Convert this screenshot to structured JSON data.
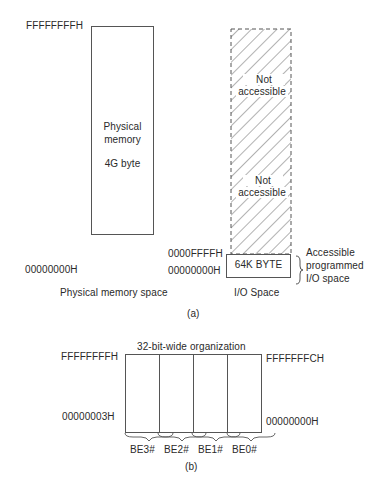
{
  "part_a": {
    "caption": "(a)",
    "physical_memory": {
      "top_address": "FFFFFFFFH",
      "bottom_address": "00000000H",
      "line1": "Physical",
      "line2": "memory",
      "size": "4G byte",
      "caption": "Physical memory space"
    },
    "io_space": {
      "not_accessible_1_line1": "Not",
      "not_accessible_1_line2": "accessible",
      "not_accessible_2_line1": "Not",
      "not_accessible_2_line2": "accessible",
      "top_address": "0000FFFFH",
      "bottom_address": "00000000H",
      "accessible_box": "64K BYTE",
      "brace_line1": "Accessible",
      "brace_line2": "programmed",
      "brace_line3": "I/O space",
      "caption": "I/O Space"
    }
  },
  "part_b": {
    "caption": "(b)",
    "title": "32-bit-wide organization",
    "top_left_address": "FFFFFFFFH",
    "top_right_address": "FFFFFFFCH",
    "bottom_left_address": "00000003H",
    "bottom_right_address": "00000000H",
    "byte_enables": [
      "BE3#",
      "BE2#",
      "BE1#",
      "BE0#"
    ]
  }
}
